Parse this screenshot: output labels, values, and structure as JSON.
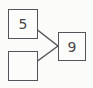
{
  "diagram": {
    "type": "number-bond",
    "boxes": [
      {
        "id": "addend-known",
        "value": "5"
      },
      {
        "id": "addend-unknown",
        "value": ""
      },
      {
        "id": "sum",
        "value": "9"
      }
    ],
    "colors": {
      "border": "#54545a",
      "line": "#54545a",
      "text": "#474747",
      "background": "#fbfbf9"
    }
  }
}
